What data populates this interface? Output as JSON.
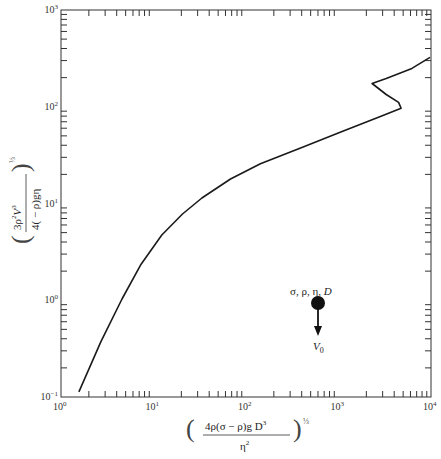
{
  "chart_data": {
    "type": "line",
    "title": "",
    "xlabel": "(4ρ(σ−ρ)gD³/η²)^(1/3)",
    "ylabel": "(3ρ²V₀³/4(−ρ)gη)^(1/3)",
    "xscale": "log",
    "yscale": "log",
    "xlim": [
      1,
      10000
    ],
    "ylim": [
      0.1,
      1000
    ],
    "grid": false,
    "legend": null,
    "x_ticks": [
      "10^0",
      "10^1",
      "10^2",
      "10^3",
      "10^4"
    ],
    "y_ticks": [
      "10^-1",
      "10^0",
      "10^1",
      "10^2",
      "10^3"
    ],
    "series": [
      {
        "name": "terminal velocity correlation",
        "x": [
          1.56,
          2.69,
          4.57,
          7.34,
          12.3,
          20.6,
          33.4,
          68.0,
          143,
          389,
          1060,
          2880,
          4750,
          4460,
          3280,
          2310,
          3280,
          6220,
          9750
        ],
        "y": [
          0.113,
          0.371,
          1.03,
          2.36,
          4.73,
          7.78,
          11.4,
          17.9,
          25.7,
          37.5,
          54.7,
          79.8,
          96.3,
          111,
          134,
          174,
          196,
          249,
          324
        ]
      }
    ],
    "annotations": [
      {
        "type": "inset",
        "label_top": "σ, ρ, η, D",
        "label_bottom": "V0",
        "description": "falling sphere with velocity arrow"
      }
    ]
  },
  "axes": {
    "x_tick_labels": [
      {
        "base": "10",
        "exp": "0"
      },
      {
        "base": "10",
        "exp": "1"
      },
      {
        "base": "10",
        "exp": "2"
      },
      {
        "base": "10",
        "exp": "3"
      },
      {
        "base": "10",
        "exp": "4"
      }
    ],
    "y_tick_labels": [
      {
        "base": "10",
        "exp": "−1"
      },
      {
        "base": "10",
        "exp": "0"
      },
      {
        "base": "10",
        "exp": "1"
      },
      {
        "base": "10",
        "exp": "2"
      },
      {
        "base": "10",
        "exp": "3"
      }
    ],
    "xlabel": {
      "numerator": "4ρ(σ − ρ)g D",
      "num_sup": "3",
      "denominator": "η",
      "den_sup": "2",
      "power": "⅓"
    },
    "ylabel": {
      "numerator": "3ρ",
      "num_sup1": "2",
      "num_mid": "V",
      "num_sub": "0",
      "num_sup2": "3",
      "denominator": "4( − ρ)gη",
      "power": "⅓"
    }
  },
  "inset": {
    "label_top": "σ, ρ, η, ",
    "label_top_italic": "D",
    "label_bottom": "V",
    "label_bottom_sub": "0"
  },
  "colors": {
    "line": "#1a1a1a",
    "axis": "#333333",
    "background": "#ffffff"
  }
}
